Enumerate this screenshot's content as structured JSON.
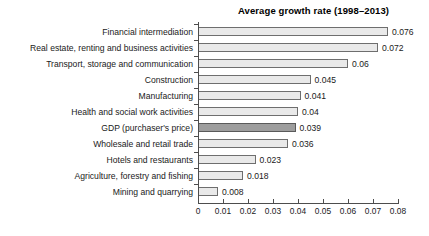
{
  "chart_data": {
    "type": "bar",
    "orientation": "horizontal",
    "title": "Average growth rate (1998–2013)",
    "xlabel": "",
    "ylabel": "",
    "xlim": [
      0,
      0.08
    ],
    "xticks": [
      "0",
      "0.01",
      "0.02",
      "0.03",
      "0.04",
      "0.05",
      "0.06",
      "0.07",
      "0.08"
    ],
    "xtick_values": [
      0,
      0.01,
      0.02,
      0.03,
      0.04,
      0.05,
      0.06,
      0.07,
      0.08
    ],
    "grid": false,
    "legend": "none",
    "categories": [
      "Financial intermediation",
      "Real estate, renting and business activities",
      "Transport, storage and communication",
      "Construction",
      "Manufacturing",
      "Health and social work activities",
      "GDP (purchaser's price)",
      "Wholesale and retail trade",
      "Hotels and restaurants",
      "Agriculture, forestry and fishing",
      "Mining and quarrying"
    ],
    "values": [
      0.076,
      0.072,
      0.06,
      0.045,
      0.041,
      0.04,
      0.039,
      0.036,
      0.023,
      0.018,
      0.008
    ],
    "value_labels": [
      "0.076",
      "0.072",
      "0.06",
      "0.045",
      "0.041",
      "0.04",
      "0.039",
      "0.036",
      "0.023",
      "0.018",
      "0.008"
    ],
    "highlight_index": 6,
    "colors": {
      "bar_fill": "#e9e9e9",
      "bar_border": "#6e6e6e",
      "highlight_fill": "#9d9d9d",
      "highlight_border": "#5a5a5a",
      "axis": "#4d4d4d",
      "text": "#1a1a1a",
      "background": "#ffffff"
    }
  }
}
